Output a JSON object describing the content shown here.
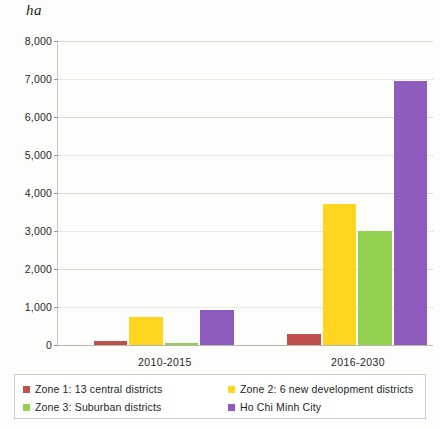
{
  "chart_data": {
    "type": "bar",
    "title": "",
    "subtitle": "",
    "xlabel": "",
    "ylabel": "ha",
    "ylim": [
      0,
      8000
    ],
    "ytick_labels": [
      "8,000",
      "7,000",
      "6,000",
      "5,000",
      "4,000",
      "3,000",
      "2,000",
      "1,000",
      "0"
    ],
    "ytick_values": [
      8000,
      7000,
      6000,
      5000,
      4000,
      3000,
      2000,
      1000,
      0
    ],
    "grid": true,
    "legend_position": "bottom",
    "categories": [
      "2010-2015",
      "2016-2030"
    ],
    "series": [
      {
        "name": "Zone 1: 13 central districts",
        "color": "#C0504D",
        "values": [
          100,
          280
        ]
      },
      {
        "name": "Zone 2: 6 new development districts",
        "color": "#FFD520",
        "values": [
          730,
          3700
        ]
      },
      {
        "name": "Zone 3: Suburban districts",
        "color": "#92D14F",
        "values": [
          60,
          3000
        ]
      },
      {
        "name": "Ho Chi Minh City",
        "color": "#8E5BBF",
        "values": [
          910,
          6950
        ]
      }
    ]
  },
  "legend": {
    "items": [
      {
        "label": "Zone 1: 13 central districts",
        "color": "#C0504D"
      },
      {
        "label": "Zone 2: 6 new development districts",
        "color": "#FFD520"
      },
      {
        "label": "Zone 3: Suburban districts",
        "color": "#92D14F"
      },
      {
        "label": "Ho Chi Minh City",
        "color": "#8E5BBF"
      }
    ]
  }
}
